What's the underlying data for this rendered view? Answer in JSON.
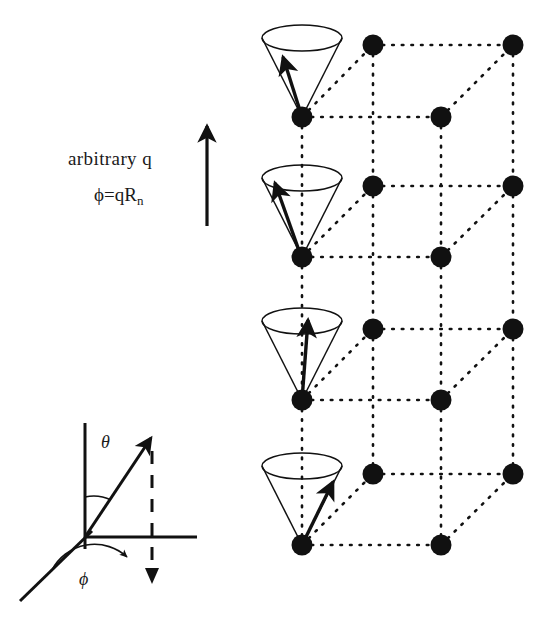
{
  "figure": {
    "type": "diagram",
    "background_color": "#ffffff",
    "ink_color": "#111111"
  },
  "labels": {
    "arbitrary_q": "arbitrary q",
    "phi_definition": "ϕ=qR",
    "phi_definition_sub": "n",
    "theta": "θ",
    "phi": "ϕ"
  },
  "wavevector_arrow": {
    "name": "q-vector-arrow",
    "x": 207,
    "y_tail": 225,
    "y_head": 123,
    "stroke_width": 3.2
  },
  "lattice": {
    "dot_radius": 10.5,
    "dot_color": "#111111",
    "dotted_line_color": "#111111",
    "dot_dash_pattern": "1.6 8",
    "layer_y_front": [
      117,
      257,
      400,
      545
    ],
    "columns": {
      "front_left_x": 302,
      "front_right_x": 441,
      "back_left_x": 373,
      "back_right_x": 513,
      "back_y_offset": -72
    },
    "sites_per_layer": 4,
    "layer_count": 4
  },
  "cones": [
    {
      "name": "precession-cone-1",
      "apex_x": 302,
      "apex_y": 117,
      "rim_cy": 38,
      "rim_rx": 40,
      "rim_ry": 13,
      "arrow_phase_deg": 196,
      "arrow_tip_x": 281,
      "arrow_tip_y": 53
    },
    {
      "name": "precession-cone-2",
      "apex_x": 302,
      "apex_y": 257,
      "rim_cy": 178,
      "rim_rx": 40,
      "rim_ry": 13,
      "arrow_phase_deg": 168,
      "arrow_tip_x": 273,
      "arrow_tip_y": 176
    },
    {
      "name": "precession-cone-3",
      "apex_x": 302,
      "apex_y": 400,
      "rim_cy": 321,
      "rim_rx": 40,
      "rim_ry": 13,
      "arrow_phase_deg": 95,
      "arrow_tip_x": 309,
      "arrow_tip_y": 312
    },
    {
      "name": "precession-cone-4",
      "apex_x": 302,
      "apex_y": 545,
      "rim_cy": 466,
      "rim_rx": 40,
      "rim_ry": 13,
      "arrow_phase_deg": 20,
      "arrow_tip_x": 336,
      "arrow_tip_y": 478
    }
  ],
  "axes_inset": {
    "name": "spherical-coordinate-inset",
    "origin_x": 85,
    "origin_y": 537,
    "z_axis_top_y": 423,
    "y_axis_right_x": 197,
    "x_axis_tip_x": 20,
    "x_axis_tip_y": 600,
    "vector_tip_x": 156,
    "vector_tip_y": 431,
    "projection_dash_x": 152,
    "projection_dash_bottom_y": 582,
    "theta_arc_radius": 40,
    "phi_arc_radius": 48
  }
}
